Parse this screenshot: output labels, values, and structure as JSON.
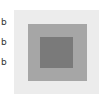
{
  "labels": [
    "b",
    "b",
    "b"
  ],
  "squares": {
    "outer": {
      "color": "#ececec"
    },
    "middle": {
      "color": "#a6a6a6"
    },
    "inner": {
      "color": "#7a7a7a"
    }
  }
}
